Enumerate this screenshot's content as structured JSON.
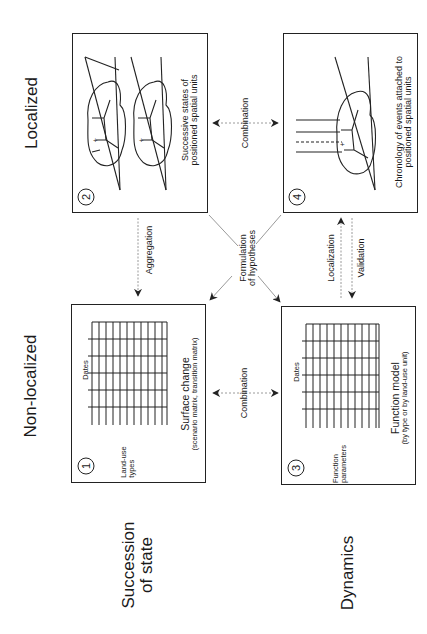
{
  "headers": {
    "localized": "Localized",
    "non_localized": "Non-localized",
    "succession_of_state": [
      "Succession",
      "of state"
    ],
    "dynamics": "Dynamics"
  },
  "boxes": [
    {
      "id": 1,
      "number": "1",
      "row_label": [
        "Land-use",
        "types"
      ],
      "col_label": "Dates",
      "caption": "Surface change",
      "subcaption": "(scenario matrix, transition matrix)"
    },
    {
      "id": 2,
      "number": "2",
      "caption": [
        "Successive states of",
        "positioned spatial units"
      ]
    },
    {
      "id": 3,
      "number": "3",
      "row_label": [
        "Function",
        "parameters"
      ],
      "col_label": "Dates",
      "caption": "Function model",
      "subcaption": "(by type or by land-use unit)"
    },
    {
      "id": 4,
      "number": "4",
      "caption": [
        "Chronology of events attached to",
        "positioned spatial units"
      ]
    }
  ],
  "arrows": {
    "aggregation": "Aggregation",
    "combination_top": "Combination",
    "combination_bottom": "Combination",
    "localization": "Localization",
    "validation": "Validation",
    "formulation": [
      "Formulation",
      "of hypotheses"
    ]
  },
  "colors": {
    "ink": "#222222",
    "arrow_dash": "#9a9a9a",
    "background": "#ffffff"
  }
}
